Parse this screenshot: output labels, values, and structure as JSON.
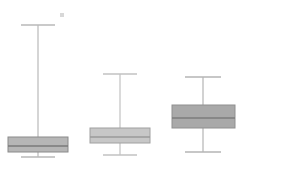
{
  "chart_data": {
    "type": "boxplot",
    "title": "",
    "subtitle": "",
    "xlabel": "",
    "ylabel": "",
    "grid": false,
    "legend": "none",
    "axes_visible": false,
    "tick_labels_x": [],
    "tick_labels_y": [],
    "orientation": "vertical",
    "background_color": "#ffffff",
    "y_axis_direction": "value-increases-upward",
    "pixel_space": {
      "width": 292,
      "height": 169
    },
    "categories": [
      "1",
      "2",
      "3"
    ],
    "boxes": [
      {
        "name": "1",
        "center_x": 38,
        "box_left": 8,
        "box_right": 68,
        "box_top_y": 137,
        "box_bottom_y": 152,
        "median_y": 146,
        "upper_whisker_y": 25,
        "lower_whisker_y": 157,
        "cap_half_width": 17,
        "fill_color": "#b6b6b6",
        "edge_color": "#8a8a8a",
        "median_color": "#7a7a7a",
        "whisker_color": "#b9b9b9",
        "outliers": [
          {
            "x": 62,
            "y": 15,
            "color": "#d8d8d8",
            "marker": "square"
          }
        ]
      },
      {
        "name": "2",
        "center_x": 120,
        "box_left": 90,
        "box_right": 150,
        "box_top_y": 128,
        "box_bottom_y": 143,
        "median_y": 137,
        "upper_whisker_y": 74,
        "lower_whisker_y": 155,
        "cap_half_width": 17,
        "fill_color": "#c7c7c7",
        "edge_color": "#a0a0a0",
        "median_color": "#9a9a9a",
        "whisker_color": "#c2c2c2",
        "outliers": []
      },
      {
        "name": "3",
        "center_x": 203,
        "box_left": 172,
        "box_right": 235,
        "box_top_y": 105,
        "box_bottom_y": 128,
        "median_y": 118,
        "upper_whisker_y": 77,
        "lower_whisker_y": 152,
        "cap_half_width": 18,
        "fill_color": "#a9a9a9",
        "edge_color": "#8f8f8f",
        "median_color": "#7d7d7d",
        "whisker_color": "#b4b4b4",
        "outliers": []
      }
    ]
  }
}
